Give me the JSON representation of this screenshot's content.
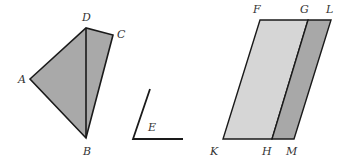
{
  "colors": {
    "stroke": "#1a1a1a",
    "quad_fill": "#a9a9a9",
    "parallelogram_light_fill": "#d6d6d6",
    "parallelogram_dark_fill": "#a8a8a8",
    "label": "#333333"
  },
  "figures": {
    "quadrilateral": {
      "vertices": {
        "A": [
          30,
          79
        ],
        "B": [
          86,
          138
        ],
        "C": [
          113,
          35
        ],
        "D": [
          86,
          28
        ]
      },
      "diagonal": [
        "D",
        "B"
      ],
      "labels": {
        "A": "A",
        "B": "B",
        "C": "C",
        "D": "D"
      }
    },
    "angle": {
      "vertex": [
        133,
        139
      ],
      "arm1_end": [
        150,
        89
      ],
      "arm2_end": [
        183,
        139
      ],
      "label": "E"
    },
    "parallelogram": {
      "vertices": {
        "F": [
          260,
          20
        ],
        "G": [
          308,
          20
        ],
        "L": [
          331,
          20
        ],
        "K": [
          223,
          139
        ],
        "H": [
          272,
          139
        ],
        "M": [
          294,
          139
        ]
      },
      "labels": {
        "F": "F",
        "G": "G",
        "L": "L",
        "K": "K",
        "H": "H",
        "M": "M"
      }
    }
  }
}
